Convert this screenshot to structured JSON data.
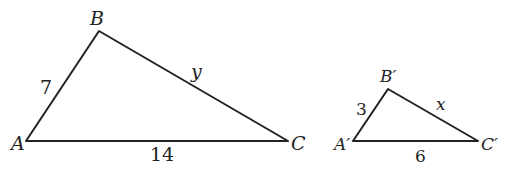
{
  "diagram": {
    "type": "similar-triangles",
    "triangles": [
      {
        "name": "ABC",
        "vertices": [
          {
            "label": "A",
            "x": 26,
            "y": 141,
            "lx": 11,
            "ly": 150
          },
          {
            "label": "B",
            "x": 99,
            "y": 31,
            "lx": 90,
            "ly": 25
          },
          {
            "label": "C",
            "x": 288,
            "y": 141,
            "lx": 291,
            "ly": 150
          }
        ],
        "sides": [
          {
            "between": "AB",
            "label": "7",
            "lx": 40,
            "ly": 94
          },
          {
            "between": "BC",
            "label": "y",
            "lx": 191,
            "ly": 78
          },
          {
            "between": "AC",
            "label": "14",
            "lx": 150,
            "ly": 161
          }
        ]
      },
      {
        "name": "A'B'C'",
        "vertices": [
          {
            "label": "A′",
            "x": 353,
            "y": 141,
            "lx": 334,
            "ly": 150
          },
          {
            "label": "B′",
            "x": 388,
            "y": 89,
            "lx": 380,
            "ly": 82
          },
          {
            "label": "C′",
            "x": 478,
            "y": 141,
            "lx": 481,
            "ly": 150
          }
        ],
        "sides": [
          {
            "between": "A'B'",
            "label": "3",
            "lx": 356,
            "ly": 115
          },
          {
            "between": "B'C'",
            "label": "x",
            "lx": 436,
            "ly": 110
          },
          {
            "between": "A'C'",
            "label": "6",
            "lx": 415,
            "ly": 162
          }
        ]
      }
    ]
  }
}
